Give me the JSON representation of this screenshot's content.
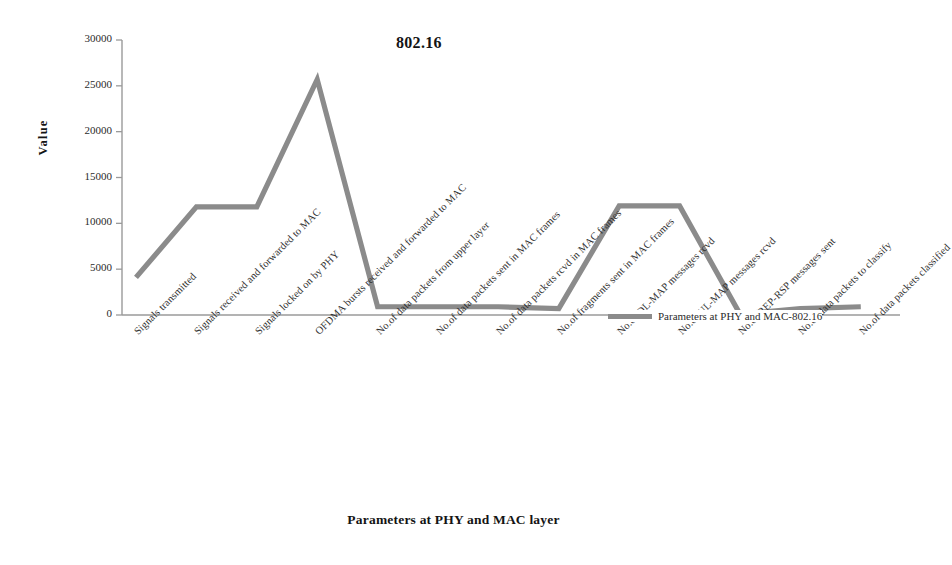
{
  "chart_data": {
    "type": "line",
    "title": "802.16",
    "xlabel": "Parameters at PHY and MAC layer",
    "ylabel": "Value",
    "ylim": [
      0,
      30000
    ],
    "yticks": [
      0,
      5000,
      10000,
      15000,
      20000,
      25000,
      30000
    ],
    "ytick_labels": [
      "0",
      "5000",
      "10000",
      "15000",
      "20000",
      "25000",
      "30000"
    ],
    "grid": false,
    "legend_position": "inside-bottom-right",
    "categories": [
      "Signals transmitted",
      "Signals received and forwarded to MAC",
      "Signals locked on by PHY",
      "OFDMA bursts received and forwarded to MAC",
      "No.of data packets from upper layer",
      "No.of data packets sent in MAC frames",
      "No.of data packets rcvd in MAC frames",
      "No.of fragments sent in MAC frames",
      "No.of DL-MAP messages rcvd",
      "No.of UL-MAP messages rcvd",
      "No.of REP-RSP messages sent",
      "No.of data packets to classify",
      "No.of data packets classified"
    ],
    "series": [
      {
        "name": "Parameters at PHY and MAC-802.16",
        "color": "#8b8b8b",
        "values": [
          4100,
          11800,
          11800,
          25700,
          900,
          900,
          900,
          700,
          11900,
          11900,
          100,
          700,
          900
        ]
      }
    ]
  },
  "legend": {
    "entries": [
      {
        "label": "Parameters at PHY and MAC-802.16",
        "color": "#8b8b8b"
      }
    ]
  }
}
